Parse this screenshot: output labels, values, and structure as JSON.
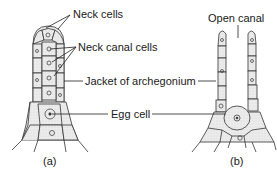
{
  "labels": {
    "neck_cells": "Neck cells",
    "neck_canal_cells": "Neck canal cells",
    "jacket": "Jacket of archegonium",
    "egg_cell": "Egg cell",
    "open_canal": "Open canal"
  },
  "captions": {
    "a": "(a)",
    "b": "(b)"
  },
  "colors": {
    "stroke": "#333333",
    "fill": "#e6e6e6",
    "text": "#1a1a1a"
  }
}
